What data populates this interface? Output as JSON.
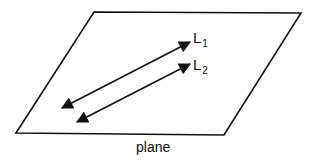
{
  "diagram": {
    "plane": {
      "label": "plane",
      "corners": [
        [
          94,
          12
        ],
        [
          301,
          13
        ],
        [
          224,
          135
        ],
        [
          16,
          133
        ]
      ],
      "stroke": "#111111"
    },
    "lines": [
      {
        "id": "L1",
        "label_main": "L",
        "label_sub": "1",
        "start": [
          62,
          108
        ],
        "end": [
          190,
          42
        ],
        "double_arrow": true
      },
      {
        "id": "L2",
        "label_main": "L",
        "label_sub": "2",
        "start": [
          77,
          122
        ],
        "end": [
          190,
          64
        ],
        "double_arrow": true
      }
    ],
    "colors": {
      "line": "#111111",
      "background": "#ffffff"
    }
  }
}
